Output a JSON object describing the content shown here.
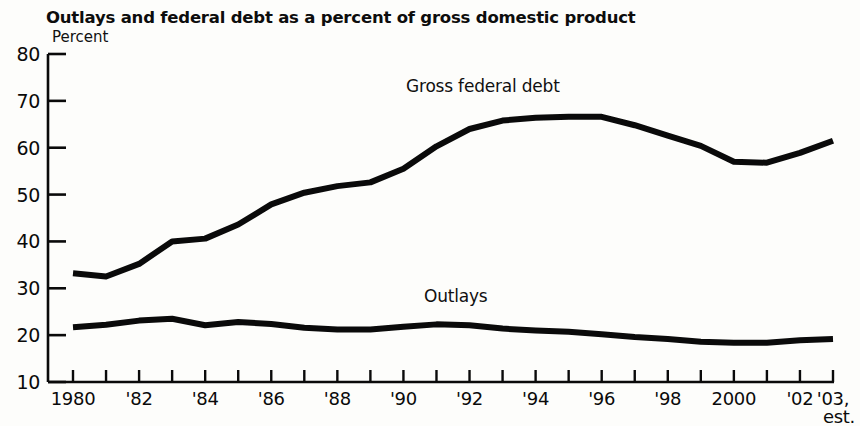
{
  "chart_data": {
    "type": "line",
    "title": "Outlays and federal debt as a percent of gross domestic product",
    "ylabel": "Percent",
    "xlabel": "",
    "ylim": [
      10,
      80
    ],
    "ytick_values": [
      10,
      20,
      30,
      40,
      50,
      60,
      70,
      80
    ],
    "ytick_labels": [
      "10",
      "20",
      "30",
      "40",
      "50",
      "60",
      "70",
      "80"
    ],
    "xlim": [
      1980,
      2003
    ],
    "xtick_values": [
      1980,
      1981,
      1982,
      1983,
      1984,
      1985,
      1986,
      1987,
      1988,
      1989,
      1990,
      1991,
      1992,
      1993,
      1994,
      1995,
      1996,
      1997,
      1998,
      1999,
      2000,
      2001,
      2002,
      2003
    ],
    "xtick_labels": [
      {
        "value": 1980,
        "label": "1980"
      },
      {
        "value": 1982,
        "label": "'82"
      },
      {
        "value": 1984,
        "label": "'84"
      },
      {
        "value": 1986,
        "label": "'86"
      },
      {
        "value": 1988,
        "label": "'88"
      },
      {
        "value": 1990,
        "label": "'90"
      },
      {
        "value": 1992,
        "label": "'92"
      },
      {
        "value": 1994,
        "label": "'94"
      },
      {
        "value": 1996,
        "label": "'96"
      },
      {
        "value": 1998,
        "label": "'98"
      },
      {
        "value": 2000,
        "label": "2000"
      },
      {
        "value": 2002,
        "label": "'02"
      },
      {
        "value": 2003,
        "label": "'03,"
      }
    ],
    "xtick_sublabel": {
      "value": 2003,
      "label": "est."
    },
    "grid": false,
    "legend_position": "inline-annotation",
    "line_color": "#0a0a0a",
    "line_width": 6,
    "x": [
      1980,
      1981,
      1982,
      1983,
      1984,
      1985,
      1986,
      1987,
      1988,
      1989,
      1990,
      1991,
      1992,
      1993,
      1994,
      1995,
      1996,
      1997,
      1998,
      1999,
      2000,
      2001,
      2002,
      2003
    ],
    "series": [
      {
        "name": "Gross federal debt",
        "annotation": "Gross federal debt",
        "values": [
          33.2,
          32.5,
          35.2,
          40.0,
          40.6,
          43.6,
          47.9,
          50.4,
          51.8,
          52.6,
          55.5,
          60.3,
          64.0,
          65.8,
          66.4,
          66.6,
          66.6,
          64.8,
          62.6,
          60.4,
          57.0,
          56.8,
          58.9,
          61.5
        ]
      },
      {
        "name": "Outlays",
        "annotation": "Outlays",
        "values": [
          21.7,
          22.2,
          23.1,
          23.5,
          22.1,
          22.8,
          22.4,
          21.6,
          21.2,
          21.2,
          21.8,
          22.3,
          22.1,
          21.4,
          21.0,
          20.7,
          20.2,
          19.6,
          19.2,
          18.6,
          18.4,
          18.4,
          18.9,
          19.2
        ]
      }
    ]
  }
}
